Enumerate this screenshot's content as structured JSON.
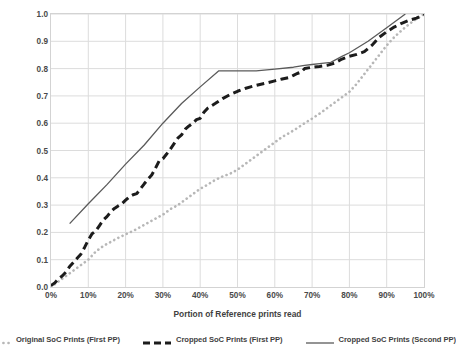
{
  "chart_data": {
    "type": "line",
    "title": "",
    "xlabel": "Portion of Reference prints read",
    "ylabel": "Probability of finding correct match",
    "xlim": [
      0,
      100
    ],
    "ylim": [
      0,
      1.0
    ],
    "grid": true,
    "legend_position": "bottom",
    "x_tick_labels": [
      "0%",
      "10%",
      "20%",
      "30%",
      "40%",
      "50%",
      "60%",
      "70%",
      "80%",
      "90%",
      "100%"
    ],
    "x_tick_values": [
      0,
      10,
      20,
      30,
      40,
      50,
      60,
      70,
      80,
      90,
      100
    ],
    "y_tick_labels": [
      "0.0",
      "0.1",
      "0.2",
      "0.3",
      "0.4",
      "0.5",
      "0.6",
      "0.7",
      "0.8",
      "0.9",
      "1.0"
    ],
    "y_tick_values": [
      0.0,
      0.1,
      0.2,
      0.3,
      0.4,
      0.5,
      0.6,
      0.7,
      0.8,
      0.9,
      1.0
    ],
    "series": [
      {
        "name": "Original SoC Prints (First PP)",
        "style": "dotted",
        "color": "#b7b7b7",
        "width": 2.6,
        "x": [
          0,
          2,
          4,
          6,
          8,
          10,
          12,
          14,
          16,
          18,
          20,
          22,
          24,
          26,
          28,
          30,
          32,
          34,
          36,
          38,
          40,
          42,
          44,
          46,
          48,
          50,
          52,
          54,
          56,
          58,
          60,
          62,
          64,
          66,
          68,
          70,
          72,
          74,
          76,
          78,
          80,
          82,
          84,
          86,
          88,
          90,
          92,
          94,
          96,
          98,
          100
        ],
        "y": [
          0.0,
          0.02,
          0.04,
          0.06,
          0.08,
          0.1,
          0.13,
          0.15,
          0.165,
          0.18,
          0.193,
          0.205,
          0.22,
          0.235,
          0.25,
          0.265,
          0.285,
          0.3,
          0.32,
          0.34,
          0.36,
          0.375,
          0.392,
          0.405,
          0.415,
          0.43,
          0.45,
          0.47,
          0.49,
          0.51,
          0.53,
          0.55,
          0.565,
          0.582,
          0.6,
          0.617,
          0.635,
          0.655,
          0.675,
          0.695,
          0.715,
          0.745,
          0.78,
          0.815,
          0.85,
          0.885,
          0.915,
          0.94,
          0.963,
          0.982,
          1.0
        ]
      },
      {
        "name": "Cropped SoC Prints (First PP)",
        "style": "dashed",
        "color": "#1c1c1c",
        "width": 3.0,
        "x": [
          0,
          1,
          2,
          3,
          4,
          5,
          6,
          7,
          8,
          9,
          10,
          11,
          12,
          13,
          14,
          15,
          16,
          17,
          18,
          19,
          20,
          21,
          22,
          23,
          24,
          25,
          26,
          27,
          28,
          29,
          30,
          31,
          32,
          33,
          34,
          35,
          36,
          37,
          38,
          39,
          40,
          41,
          42,
          44,
          46,
          48,
          50,
          52,
          54,
          56,
          58,
          60,
          62,
          64,
          65,
          66,
          67,
          68,
          70,
          72,
          74,
          76,
          78,
          80,
          82,
          84,
          86,
          88,
          90,
          92,
          94,
          96,
          98,
          100
        ],
        "y": [
          0.005,
          0.015,
          0.03,
          0.04,
          0.055,
          0.075,
          0.09,
          0.105,
          0.12,
          0.145,
          0.172,
          0.195,
          0.205,
          0.225,
          0.245,
          0.258,
          0.275,
          0.288,
          0.297,
          0.305,
          0.318,
          0.33,
          0.338,
          0.342,
          0.36,
          0.378,
          0.395,
          0.41,
          0.435,
          0.462,
          0.47,
          0.487,
          0.505,
          0.525,
          0.545,
          0.557,
          0.578,
          0.59,
          0.6,
          0.613,
          0.618,
          0.64,
          0.655,
          0.672,
          0.69,
          0.705,
          0.717,
          0.727,
          0.735,
          0.742,
          0.748,
          0.755,
          0.762,
          0.768,
          0.775,
          0.782,
          0.787,
          0.8,
          0.805,
          0.808,
          0.812,
          0.82,
          0.835,
          0.845,
          0.852,
          0.862,
          0.885,
          0.915,
          0.935,
          0.952,
          0.966,
          0.977,
          0.985,
          0.998
        ]
      },
      {
        "name": "Cropped SoC Prints (Second PP)",
        "style": "solid",
        "color": "#5a5a5a",
        "width": 1.3,
        "x": [
          5,
          10,
          15,
          20,
          25,
          30,
          35,
          40,
          45,
          50,
          55,
          60,
          65,
          68,
          70,
          72,
          75,
          78,
          80,
          85,
          90,
          95
        ],
        "y": [
          0.232,
          0.305,
          0.375,
          0.45,
          0.52,
          0.6,
          0.672,
          0.733,
          0.792,
          0.792,
          0.792,
          0.798,
          0.805,
          0.812,
          0.815,
          0.818,
          0.823,
          0.845,
          0.858,
          0.9,
          0.95,
          1.0
        ]
      }
    ]
  },
  "legend": {
    "items": [
      {
        "label": "Original SoC Prints (First PP)",
        "style": "dotted"
      },
      {
        "label": "Cropped SoC Prints (First PP)",
        "style": "dashed"
      },
      {
        "label": "Cropped SoC Prints (Second PP)",
        "style": "solid"
      }
    ]
  },
  "axes": {
    "x_title": "Portion of Reference prints read",
    "y_title": "Probability of finding correct match"
  },
  "colors": {
    "grid": "#dcdcdc",
    "frame": "#d3d3d3",
    "text": "#3f3f3f",
    "series_dotted": "#b7b7b7",
    "series_dashed": "#1c1c1c",
    "series_solid": "#5a5a5a"
  }
}
